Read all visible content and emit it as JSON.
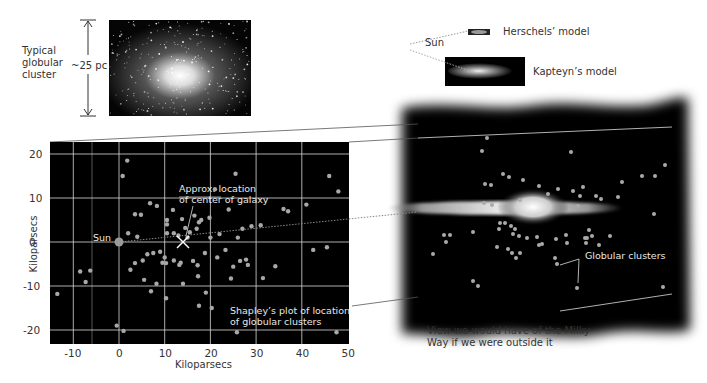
{
  "cluster_inset": {
    "label_lines": [
      "Typical",
      "globular",
      "cluster"
    ],
    "size_label": "~25 pc"
  },
  "models": {
    "sun_label": "Sun",
    "herschel_label": "Herschels’ model",
    "kapteyn_label": "Kapteyn’s model"
  },
  "plot": {
    "sun_label": "Sun",
    "center_annotation": [
      "Approx. location",
      "of center of galaxy"
    ],
    "caption": [
      "Shapley’s plot of location",
      "of globular clusters"
    ],
    "xlabel": "Kiloparsecs",
    "ylabel": "Kiloparsecs"
  },
  "outside_view": {
    "clusters_label": "Globular clusters",
    "caption": [
      "View we would have of the Milky",
      "Way if we were outside it"
    ]
  },
  "colors": {
    "plot_bg": "#000000",
    "grid": "#d8d8d8",
    "cluster_dot": "#a8a8a8",
    "sun_dot": "#9a9a9a"
  },
  "chart_data": {
    "type": "scatter",
    "title": "Shapley’s plot of location of globular clusters",
    "xlabel": "Kiloparsecs",
    "ylabel": "Kiloparsecs",
    "xlim": [
      -15,
      50
    ],
    "ylim": [
      -22,
      23
    ],
    "xticks": [
      -10,
      0,
      10,
      20,
      30,
      40,
      50
    ],
    "yticks": [
      -20,
      -10,
      0,
      10,
      20
    ],
    "grid": true,
    "annotations": [
      {
        "text": "Sun",
        "x": 0,
        "y": 0
      },
      {
        "text": "Approx. location of center of galaxy",
        "x": 14,
        "y": 0
      }
    ],
    "series": [
      {
        "name": "Globular clusters",
        "points": [
          [
            1.8,
            18.5
          ],
          [
            0.8,
            15
          ],
          [
            3.5,
            6.3
          ],
          [
            4.8,
            6.2
          ],
          [
            6.8,
            8.8
          ],
          [
            8.3,
            8.2
          ],
          [
            2,
            2
          ],
          [
            4,
            1.2
          ],
          [
            11.8,
            7.3
          ],
          [
            13.8,
            5.2
          ],
          [
            10.5,
            5
          ],
          [
            10.5,
            4
          ],
          [
            10.5,
            2
          ],
          [
            12,
            2
          ],
          [
            13,
            1.5
          ],
          [
            15.5,
            2.2
          ],
          [
            16.5,
            6
          ],
          [
            18,
            5
          ],
          [
            17.5,
            4.5
          ],
          [
            14.5,
            3.2
          ],
          [
            15,
            1
          ],
          [
            17,
            3
          ],
          [
            19.8,
            5.5
          ],
          [
            20,
            1
          ],
          [
            22,
            1.8
          ],
          [
            24,
            7.4
          ],
          [
            26,
            1
          ],
          [
            27,
            3
          ],
          [
            29,
            3.6
          ],
          [
            31,
            3.8
          ],
          [
            36,
            7.5
          ],
          [
            37,
            7
          ],
          [
            41,
            8.5
          ],
          [
            46,
            15
          ],
          [
            48,
            11.5
          ],
          [
            25.5,
            15.5
          ],
          [
            21,
            12
          ],
          [
            -8.5,
            -6.7
          ],
          [
            -7.3,
            -9.1
          ],
          [
            -6.3,
            -6.5
          ],
          [
            -13.5,
            -11.8
          ],
          [
            3.5,
            -4.8
          ],
          [
            5.2,
            -4.2
          ],
          [
            2.5,
            -6.3
          ],
          [
            5.5,
            -8.6
          ],
          [
            7,
            -11.2
          ],
          [
            8.2,
            -9.5
          ],
          [
            6.2,
            -2.8
          ],
          [
            7.5,
            -2.5
          ],
          [
            9,
            -2.2
          ],
          [
            10,
            -3.5
          ],
          [
            9.5,
            -4.7
          ],
          [
            10.3,
            -4.8
          ],
          [
            12,
            -4.2
          ],
          [
            13.5,
            -4.7
          ],
          [
            16.2,
            -4.3
          ],
          [
            17.2,
            -5.3
          ],
          [
            17.3,
            -7.8
          ],
          [
            18.8,
            -2.5
          ],
          [
            21.5,
            -3.5
          ],
          [
            23.3,
            -1.8
          ],
          [
            25,
            -5.6
          ],
          [
            26.5,
            -4.3
          ],
          [
            27.8,
            -4
          ],
          [
            28.2,
            -5.2
          ],
          [
            19,
            -11.5
          ],
          [
            24.5,
            -8.3
          ],
          [
            31.5,
            -8.2
          ],
          [
            34.2,
            -5.5
          ],
          [
            42.5,
            -1.8
          ],
          [
            45.5,
            -1.2
          ],
          [
            10.3,
            -12.8
          ],
          [
            14,
            -9.5
          ],
          [
            17.5,
            -14.5
          ],
          [
            20.3,
            -15
          ],
          [
            13.2,
            -5.2
          ],
          [
            -0.5,
            -19
          ],
          [
            1,
            -20.2
          ],
          [
            25.8,
            -20.5
          ],
          [
            47.6,
            -20.5
          ]
        ]
      }
    ],
    "sun": [
      0,
      0
    ],
    "galactic_center": [
      14,
      0
    ]
  }
}
